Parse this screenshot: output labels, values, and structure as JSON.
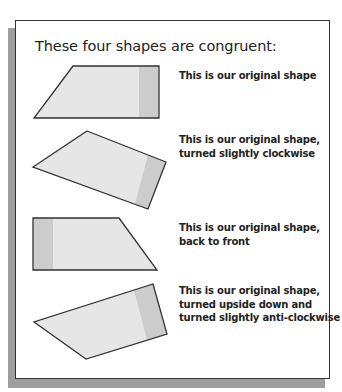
{
  "title": "These four shapes are congruent:",
  "colors": {
    "shape_fill": "#e6e6e6",
    "shape_band": "#cccccc",
    "outline": "#333333",
    "shadow": "#9e9e9e"
  },
  "shapes": [
    {
      "caption_lines": [
        "This is our original shape"
      ]
    },
    {
      "caption_lines": [
        "This is our original shape,",
        "turned slightly clockwise"
      ]
    },
    {
      "caption_lines": [
        "This is our original shape,",
        "back to front"
      ]
    },
    {
      "caption_lines": [
        "This is our original shape,",
        "turned upside down and",
        "turned slightly anti-clockwise"
      ]
    }
  ]
}
